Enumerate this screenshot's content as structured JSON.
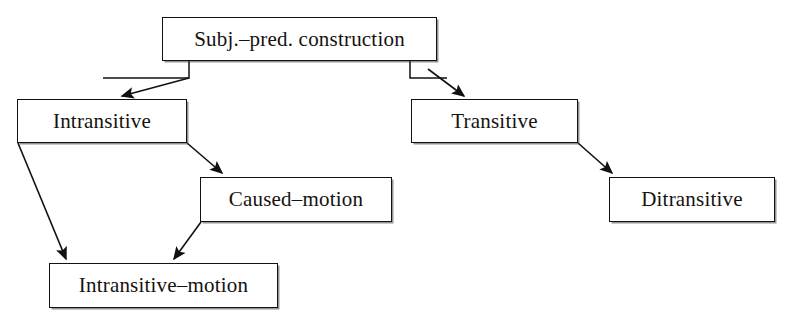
{
  "diagram": {
    "type": "tree-diagram",
    "stroke_color": "#111111",
    "fill_color": "#ffffff",
    "text_color": "#16120f",
    "nodes": [
      {
        "id": "root",
        "label": "Subj.–pred. construction",
        "x": 162,
        "y": 17,
        "w": 275,
        "h": 44
      },
      {
        "id": "intrans",
        "label": "Intransitive",
        "x": 17,
        "y": 99,
        "w": 170,
        "h": 44
      },
      {
        "id": "trans",
        "label": "Transitive",
        "x": 411,
        "y": 99,
        "w": 167,
        "h": 44
      },
      {
        "id": "caused",
        "label": "Caused–motion",
        "x": 200,
        "y": 177,
        "w": 192,
        "h": 45
      },
      {
        "id": "ditrans",
        "label": "Ditransitive",
        "x": 609,
        "y": 177,
        "w": 166,
        "h": 45
      },
      {
        "id": "intransm",
        "label": "Intransitive–motion",
        "x": 49,
        "y": 263,
        "w": 229,
        "h": 45
      }
    ],
    "edges": [
      {
        "id": "root-intrans",
        "from": "root",
        "to": "intrans",
        "arrow": true
      },
      {
        "id": "root-trans",
        "from": "root",
        "to": "trans",
        "arrow": true
      },
      {
        "id": "intrans-caused",
        "from": "intrans",
        "to": "caused",
        "arrow": true
      },
      {
        "id": "intrans-intransm",
        "from": "intrans",
        "to": "intransm",
        "arrow": true
      },
      {
        "id": "caused-intransm",
        "from": "caused",
        "to": "intransm",
        "arrow": true
      },
      {
        "id": "trans-ditrans",
        "from": "trans",
        "to": "ditrans",
        "arrow": true
      }
    ]
  }
}
